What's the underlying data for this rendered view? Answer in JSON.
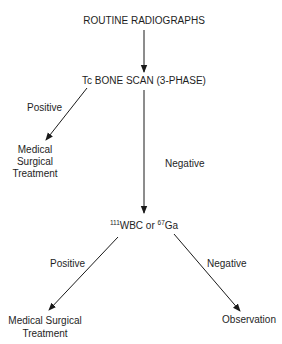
{
  "diagram": {
    "type": "flowchart",
    "nodes": {
      "start": {
        "label": "ROUTINE RADIOGRAPHS"
      },
      "bone_scan": {
        "label": "Tc BONE SCAN (3-PHASE)"
      },
      "treatment_1": {
        "lines": [
          "Medical",
          "Surgical",
          "Treatment"
        ]
      },
      "wbc_ga": {
        "sup1": "111",
        "text1": "WBC or ",
        "sup2": "67",
        "text2": "Ga"
      },
      "treatment_2": {
        "lines": [
          "Medical Surgical",
          "Treatment"
        ]
      },
      "observation": {
        "label": "Observation"
      }
    },
    "edges": [
      {
        "from": "start",
        "to": "bone_scan",
        "label": ""
      },
      {
        "from": "bone_scan",
        "to": "treatment_1",
        "label": "Positive"
      },
      {
        "from": "bone_scan",
        "to": "wbc_ga",
        "label": "Negative"
      },
      {
        "from": "wbc_ga",
        "to": "treatment_2",
        "label": "Positive"
      },
      {
        "from": "wbc_ga",
        "to": "observation",
        "label": "Negative"
      }
    ],
    "colors": {
      "line": "#1a1a1a",
      "text": "#1e1e1e",
      "background": "#ffffff"
    }
  }
}
